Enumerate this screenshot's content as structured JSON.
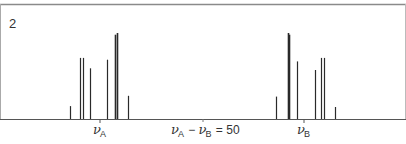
{
  "chart_data": {
    "type": "bar",
    "title": "",
    "panel_label": "2",
    "xlabel": "",
    "ylabel": "",
    "grid": false,
    "annotation": "νA − νB = 50",
    "ticks": [
      {
        "label": "νA",
        "x_px": 100
      },
      {
        "label": "νB",
        "x_px": 304
      }
    ],
    "baseline_px": 119,
    "lines": [
      {
        "group": "A",
        "x_px": 70,
        "height_rel": 0.15
      },
      {
        "group": "A",
        "x_px": 80,
        "height_rel": 0.71
      },
      {
        "group": "A",
        "x_px": 83,
        "height_rel": 0.71
      },
      {
        "group": "A",
        "x_px": 90,
        "height_rel": 0.59
      },
      {
        "group": "A",
        "x_px": 107,
        "height_rel": 0.69
      },
      {
        "group": "A",
        "x_px": 115,
        "height_rel": 0.98
      },
      {
        "group": "A",
        "x_px": 117,
        "height_rel": 1.0
      },
      {
        "group": "A",
        "x_px": 128,
        "height_rel": 0.27
      },
      {
        "group": "B",
        "x_px": 276,
        "height_rel": 0.26
      },
      {
        "group": "B",
        "x_px": 288,
        "height_rel": 1.0
      },
      {
        "group": "B",
        "x_px": 289,
        "height_rel": 0.98
      },
      {
        "group": "B",
        "x_px": 297,
        "height_rel": 0.67
      },
      {
        "group": "B",
        "x_px": 315,
        "height_rel": 0.57
      },
      {
        "group": "B",
        "x_px": 321,
        "height_rel": 0.71
      },
      {
        "group": "B",
        "x_px": 324,
        "height_rel": 0.71
      },
      {
        "group": "B",
        "x_px": 335,
        "height_rel": 0.14
      }
    ]
  },
  "labels": {
    "panel": "2",
    "nu_a_main": "ν",
    "nu_a_sub": "A",
    "nu_b_main": "ν",
    "nu_b_sub": "B",
    "diff_nu1": "ν",
    "diff_sub1": "A",
    "diff_minus": " − ",
    "diff_nu2": "ν",
    "diff_sub2": "B",
    "diff_eq": " = 50"
  },
  "colors": {
    "line": "#2a2a2a",
    "border": "#8a8a8a",
    "axis": "#555555"
  }
}
